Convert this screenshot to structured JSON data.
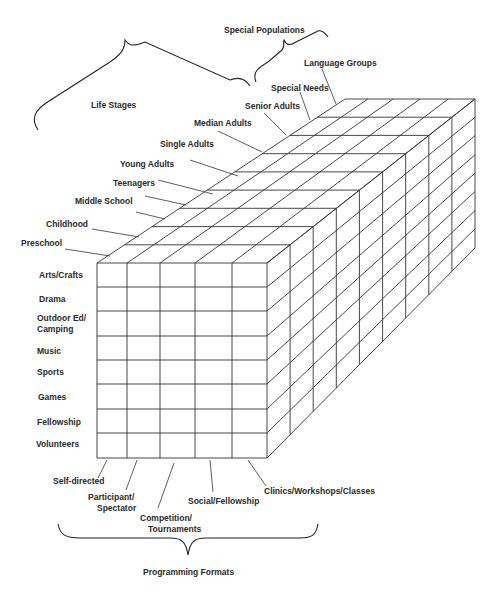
{
  "figure": {
    "groups": {
      "special_populations": "Special Populations",
      "life_stages": "Life Stages",
      "programming_formats": "Programming Formats"
    },
    "depth_axis": {
      "label_groups": [
        "Life Stages",
        "Special Populations"
      ],
      "items": [
        "Preschool",
        "Childhood",
        "Middle School",
        "Teenagers",
        "Young Adults",
        "Single Adults",
        "Median Adults",
        "Senior Adults",
        "Special Needs",
        "Language Groups"
      ]
    },
    "rows_axis": {
      "items": [
        "Arts/Crafts",
        "Drama",
        "Outdoor Ed/",
        "Camping",
        "Music",
        "Sports",
        "Games",
        "Fellowship",
        "Volunteers"
      ]
    },
    "columns_axis": {
      "label": "Programming Formats",
      "items": [
        "Self-directed",
        "Participant/",
        "Spectator",
        "Competition/",
        "Tournaments",
        "Social/Fellowship",
        "Clinics/Workshops/Classes"
      ]
    },
    "colors": {
      "line": "#333333",
      "background": "#ffffff"
    }
  }
}
